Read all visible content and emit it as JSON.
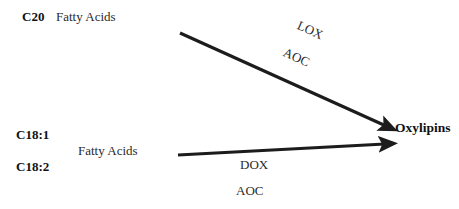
{
  "diagram": {
    "background_color": "#ffffff",
    "line_color": "#1c1c1c",
    "text_color": "#2a2a2a",
    "substrates": {
      "c20_prefix": "C20",
      "c20_name": "Fatty Acids",
      "c18_1_prefix": "C18:1",
      "c18_2_prefix": "C18:2",
      "c18_name": "Fatty Acids"
    },
    "product": {
      "name": "Oxylipins"
    },
    "enzymes": {
      "upper_primary": "LOX",
      "upper_secondary": "AOC",
      "lower_primary": "DOX",
      "lower_secondary": "AOC"
    },
    "arrows": [
      {
        "id": "upper-arrow",
        "from": "C20 Fatty Acids",
        "to": "Oxylipins",
        "labels": [
          "LOX",
          "AOC"
        ],
        "x1": 180,
        "y1": 33,
        "x2": 391,
        "y2": 128
      },
      {
        "id": "lower-arrow",
        "from": "C18:1 / C18:2 Fatty Acids",
        "to": "Oxylipins",
        "labels": [
          "DOX",
          "AOC"
        ],
        "x1": 178,
        "y1": 155,
        "x2": 391,
        "y2": 143
      }
    ]
  }
}
